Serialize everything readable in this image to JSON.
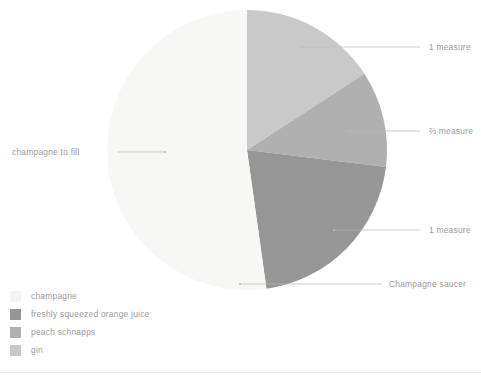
{
  "chart_data": {
    "type": "pie",
    "title": "",
    "subtitle": "",
    "xlabel": "",
    "ylabel": "",
    "legend_position": "bottom-left",
    "grid": false,
    "center": {
      "x": 247,
      "y": 150
    },
    "radius": 140,
    "start_angle_deg": 0,
    "direction": "clockwise",
    "categories": [
      "gin",
      "freshly squeezed orange juice",
      "peach schnapps",
      "champagne"
    ],
    "values": [
      15.8,
      11.1,
      20.8,
      52.3
    ],
    "slices": [
      {
        "label": "gin",
        "measure": "1 measure",
        "color": "#c9c9c9",
        "start_deg": 0,
        "end_deg": 57,
        "percent": 15.8
      },
      {
        "label": "freshly squeezed orange juice",
        "measure": "⅔ measure",
        "color": "#b0b0b0",
        "start_deg": 57,
        "end_deg": 97,
        "percent": 11.1
      },
      {
        "label": "peach schnapps",
        "measure": "1 measure",
        "color": "#969696",
        "start_deg": 97,
        "end_deg": 172,
        "percent": 20.8
      },
      {
        "label": "champagne",
        "measure": "champagne to fill",
        "color": "#f7f7f5",
        "start_deg": 172,
        "end_deg": 360,
        "percent": 52.3
      }
    ],
    "annotations": [
      {
        "text": "1 measure",
        "target": "gin"
      },
      {
        "text": "⅔ measure",
        "target": "freshly squeezed orange juice"
      },
      {
        "text": "1 measure",
        "target": "peach schnapps"
      },
      {
        "text": "Champagne saucer",
        "target": "glassware"
      },
      {
        "text": "champagne to fill",
        "target": "champagne"
      }
    ]
  },
  "annotations": {
    "gin_measure": "1 measure",
    "orange_juice_measure": "⅔ measure",
    "peach_schnapps_measure": "1 measure",
    "glassware": "Champagne saucer",
    "champagne_fill": "champagne to fill"
  },
  "legend": {
    "items": [
      {
        "label": "champagne",
        "color": "#f4f4f1"
      },
      {
        "label": "freshly squeezed orange juice",
        "color": "#969696"
      },
      {
        "label": "peach schnapps",
        "color": "#b0b0b0"
      },
      {
        "label": "gin",
        "color": "#c9c9c9"
      }
    ]
  },
  "colors": {
    "leader_line": "#b9b9b9",
    "text": "#9a9a9a",
    "baseline": "#e8e8e8",
    "background": "#ffffff"
  }
}
